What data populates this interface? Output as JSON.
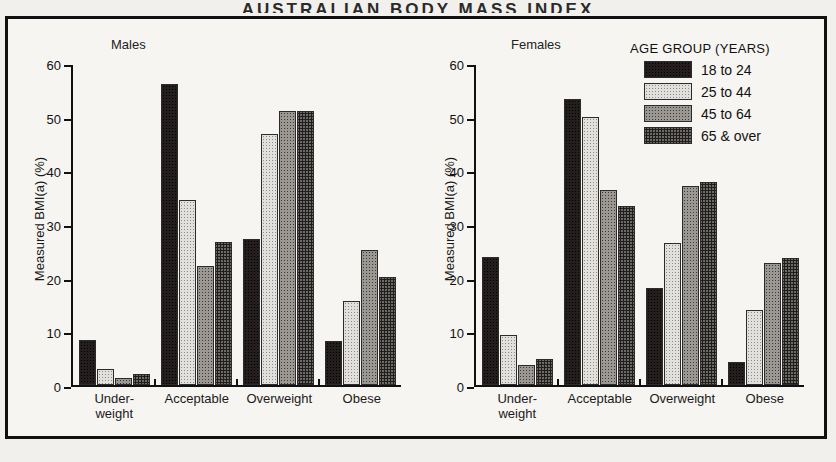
{
  "page_title": "AUSTRALIAN BODY MASS INDEX",
  "legend": {
    "title": "AGE GROUP (YEARS)",
    "items": [
      {
        "label": "18 to 24",
        "pattern": "solid-black"
      },
      {
        "label": "25 to 44",
        "pattern": "light-stipple"
      },
      {
        "label": "45 to 64",
        "pattern": "medium-stipple"
      },
      {
        "label": "65 & over",
        "pattern": "dark-stipple"
      }
    ]
  },
  "chart_data": [
    {
      "type": "bar",
      "title": "Males",
      "xlabel": "",
      "ylabel": "Measured BMI(a) (%)",
      "ylim": [
        0,
        60
      ],
      "yticks": [
        0,
        10,
        20,
        30,
        40,
        50,
        60
      ],
      "grid": false,
      "legend_position": "top-right",
      "categories": [
        "Under-weight",
        "Acceptable",
        "Overweight",
        "Obese"
      ],
      "category_lines": [
        [
          "Under-",
          "weight"
        ],
        [
          "Acceptable"
        ],
        [
          "Overweight"
        ],
        [
          "Obese"
        ]
      ],
      "series": [
        {
          "name": "18 to 24",
          "values": [
            8.5,
            56.5,
            27.3,
            8.2
          ]
        },
        {
          "name": "25 to 44",
          "values": [
            3.0,
            34.7,
            47.0,
            15.7
          ]
        },
        {
          "name": "45 to 64",
          "values": [
            1.3,
            22.3,
            51.4,
            25.3
          ]
        },
        {
          "name": "65 & over",
          "values": [
            2.0,
            26.8,
            51.4,
            20.2
          ]
        }
      ]
    },
    {
      "type": "bar",
      "title": "Females",
      "xlabel": "",
      "ylabel": "Measured BMI(a) (%)",
      "ylim": [
        0,
        60
      ],
      "yticks": [
        0,
        10,
        20,
        30,
        40,
        50,
        60
      ],
      "grid": false,
      "legend_position": "top-right",
      "categories": [
        "Under-weight",
        "Acceptable",
        "Overweight",
        "Obese"
      ],
      "category_lines": [
        [
          "Under-",
          "weight"
        ],
        [
          "Acceptable"
        ],
        [
          "Overweight"
        ],
        [
          "Obese"
        ]
      ],
      "series": [
        {
          "name": "18 to 24",
          "values": [
            24.0,
            53.7,
            18.2,
            4.3
          ]
        },
        {
          "name": "25 to 44",
          "values": [
            9.3,
            50.3,
            26.6,
            14.0
          ]
        },
        {
          "name": "45 to 64",
          "values": [
            3.7,
            36.5,
            37.3,
            22.8
          ]
        },
        {
          "name": "65 & over",
          "values": [
            4.8,
            33.5,
            38.0,
            23.8
          ]
        }
      ]
    }
  ]
}
